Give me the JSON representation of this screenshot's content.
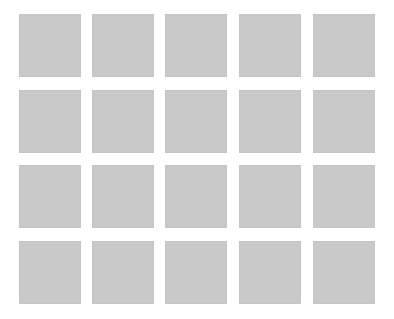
{
  "grid": {
    "rows": 4,
    "columns": 5,
    "tile_color": "#c9c9c9",
    "background_color": "#ffffff",
    "col_x": [
      19,
      92,
      165,
      239,
      313
    ],
    "row_y": [
      14,
      90,
      165,
      241
    ],
    "tile_width": 62,
    "tile_height": 63
  }
}
